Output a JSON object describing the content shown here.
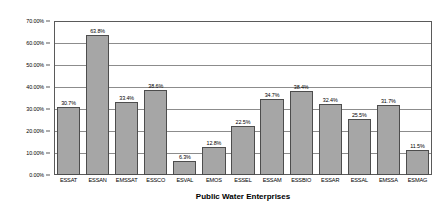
{
  "chart_data": {
    "type": "bar",
    "title": "",
    "subtitle": "",
    "xlabel": "Public Water Enterprises",
    "ylabel": "",
    "ylim": [
      0,
      70
    ],
    "grid": true,
    "legend": "none",
    "value_suffix": "%",
    "categories": [
      "ESSAT",
      "ESSAN",
      "EMSSAT",
      "ESSCO",
      "ESVAL",
      "EMOS",
      "ESSEL",
      "ESSAM",
      "ESSBIO",
      "ESSAR",
      "ESSAL",
      "EMSSA",
      "ESMAG"
    ],
    "values": [
      30.7,
      63.8,
      33.4,
      38.6,
      6.3,
      12.8,
      22.5,
      34.7,
      38.4,
      32.4,
      25.5,
      31.7,
      11.5
    ],
    "data_labels": [
      "30.7%",
      "63.8%",
      "33.4%",
      "38.6%",
      "6.3%",
      "12.8%",
      "22.5%",
      "34.7%",
      "38.4%",
      "32.4%",
      "25.5%",
      "31.7%",
      "11.5%"
    ],
    "y_ticks": [
      0,
      10,
      20,
      30,
      40,
      50,
      60,
      70
    ],
    "y_tick_labels": [
      "0.00%",
      "10.00%",
      "20.00%",
      "30.00%",
      "40.00%",
      "50.00%",
      "60.00%",
      "70.00%"
    ],
    "colors": {
      "bar_fill": "#a6a6a6",
      "bar_border": "#4d4d4d",
      "gridline": "#8c8c8c",
      "axis": "#5a5a5a",
      "background": "#ffffff",
      "text": "#000000"
    }
  }
}
